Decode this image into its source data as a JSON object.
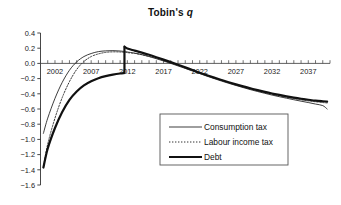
{
  "chart_data": {
    "type": "line",
    "title": "Tobin's q",
    "title_plain": "Tobin's ",
    "title_italic": "q",
    "xlabel": "",
    "ylabel": "",
    "xlim": [
      2000,
      2040
    ],
    "ylim": [
      -1.6,
      0.4
    ],
    "ytick_values": [
      0.4,
      0.2,
      0.0,
      -0.2,
      -0.4,
      -0.6,
      -0.8,
      -1.0,
      -1.2,
      -1.4,
      -1.6
    ],
    "ytick_labels": [
      "0.4",
      "0.2",
      "0.0",
      "−0.2",
      "−0.4",
      "−0.6",
      "−0.8",
      "−1.0",
      "−1.2",
      "−1.4",
      "−1.6"
    ],
    "xtick_values": [
      2002,
      2007,
      2012,
      2017,
      2022,
      2027,
      2032,
      2037
    ],
    "xtick_labels": [
      "2002",
      "2007",
      "2012",
      "2017",
      "2022",
      "2027",
      "2032",
      "2037"
    ],
    "grid": false,
    "zero_axis": true,
    "legend_position": "lower-right-inside",
    "series": [
      {
        "name": "Consumption tax",
        "style": "thin-solid",
        "color": "#1a1a1a",
        "x": [
          2000.4,
          2001,
          2002,
          2003,
          2004,
          2005,
          2006,
          2007,
          2008,
          2009,
          2010,
          2011,
          2011.9,
          2012,
          2013,
          2014,
          2015,
          2016,
          2017,
          2018,
          2019,
          2020,
          2021,
          2022,
          2023,
          2024,
          2025,
          2026,
          2027,
          2028,
          2029,
          2030,
          2031,
          2032,
          2033,
          2034,
          2035,
          2036,
          2037,
          2038,
          2039,
          2039.6
        ],
        "y": [
          -0.92,
          -0.72,
          -0.46,
          -0.25,
          -0.09,
          0.02,
          0.09,
          0.13,
          0.155,
          0.165,
          0.168,
          0.163,
          0.152,
          0.15,
          0.135,
          0.115,
          0.09,
          0.062,
          0.032,
          0.0,
          -0.033,
          -0.066,
          -0.1,
          -0.134,
          -0.168,
          -0.2,
          -0.232,
          -0.262,
          -0.29,
          -0.318,
          -0.345,
          -0.37,
          -0.394,
          -0.417,
          -0.438,
          -0.458,
          -0.478,
          -0.497,
          -0.515,
          -0.535,
          -0.555,
          -0.6
        ]
      },
      {
        "name": "Labour income tax",
        "style": "dotted",
        "color": "#333333",
        "x": [
          2000.4,
          2001,
          2002,
          2003,
          2004,
          2005,
          2006,
          2007,
          2008,
          2009,
          2010,
          2011,
          2011.9,
          2012,
          2013,
          2014,
          2015,
          2016,
          2017,
          2018,
          2019,
          2020,
          2021,
          2022,
          2023,
          2024,
          2025,
          2026,
          2027,
          2028,
          2029,
          2030,
          2031,
          2032,
          2033,
          2034,
          2035,
          2036,
          2037,
          2038,
          2039,
          2039.6
        ],
        "y": [
          -1.37,
          -1.06,
          -0.72,
          -0.45,
          -0.24,
          -0.08,
          0.025,
          0.09,
          0.125,
          0.145,
          0.152,
          0.15,
          0.143,
          0.142,
          0.132,
          0.115,
          0.093,
          0.068,
          0.04,
          0.01,
          -0.022,
          -0.055,
          -0.09,
          -0.124,
          -0.158,
          -0.19,
          -0.222,
          -0.252,
          -0.281,
          -0.308,
          -0.334,
          -0.359,
          -0.383,
          -0.405,
          -0.426,
          -0.445,
          -0.463,
          -0.479,
          -0.493,
          -0.505,
          -0.515,
          -0.52
        ]
      },
      {
        "name": "Debt",
        "style": "thick-solid",
        "color": "#111111",
        "x": [
          2000.4,
          2001,
          2002,
          2003,
          2004,
          2005,
          2006,
          2007,
          2008,
          2009,
          2010,
          2011,
          2011.55,
          2011.6,
          2012,
          2013,
          2014,
          2015,
          2016,
          2017,
          2018,
          2019,
          2020,
          2021,
          2022,
          2023,
          2024,
          2025,
          2026,
          2027,
          2028,
          2029,
          2030,
          2031,
          2032,
          2033,
          2034,
          2035,
          2036,
          2037,
          2038,
          2039,
          2039.6
        ],
        "y": [
          -1.37,
          -1.12,
          -0.85,
          -0.64,
          -0.48,
          -0.37,
          -0.29,
          -0.235,
          -0.195,
          -0.168,
          -0.148,
          -0.133,
          -0.128,
          0.222,
          0.195,
          0.168,
          0.142,
          0.113,
          0.082,
          0.05,
          0.017,
          -0.017,
          -0.052,
          -0.088,
          -0.122,
          -0.155,
          -0.187,
          -0.218,
          -0.248,
          -0.276,
          -0.303,
          -0.328,
          -0.352,
          -0.375,
          -0.396,
          -0.415,
          -0.433,
          -0.45,
          -0.465,
          -0.478,
          -0.49,
          -0.498,
          -0.502
        ],
        "jump": {
          "year": 2011.6,
          "from": -0.128,
          "to": 0.222
        }
      }
    ],
    "legend": [
      {
        "label": "Consumption tax",
        "style": "thin-solid"
      },
      {
        "label": "Labour income tax",
        "style": "dotted"
      },
      {
        "label": "Debt",
        "style": "thick-solid"
      }
    ]
  }
}
